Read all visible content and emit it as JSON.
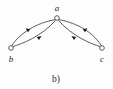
{
  "figure": {
    "caption": "b)",
    "background_color": "#fdfdfd",
    "stroke_color": "#4a4a4a",
    "arrow_color": "#1c1c1c",
    "label_color": "#262626"
  },
  "graph": {
    "type": "directed-graph",
    "nodes": [
      {
        "id": "a",
        "label": "a",
        "x": 57,
        "y": 18,
        "r": 2.3,
        "label_x": 57,
        "label_y": 11
      },
      {
        "id": "b",
        "label": "b",
        "x": 11,
        "y": 48,
        "r": 2.3,
        "label_x": 11,
        "label_y": 62
      },
      {
        "id": "c",
        "label": "c",
        "x": 102,
        "y": 48,
        "r": 2.3,
        "label_x": 102,
        "label_y": 62
      }
    ],
    "edges": [
      {
        "id": "a-to-b",
        "from": "a",
        "to": "b",
        "direction": "a→b",
        "path": "M 55.2 19.6 C 42 22 23 29 11.4 46",
        "arrow_at": {
          "x": 25.5,
          "y": 28.2,
          "angle": 215
        }
      },
      {
        "id": "b-to-a",
        "from": "b",
        "to": "a",
        "direction": "b→a",
        "path": "M 12.6 46.6 C 22 44 42 36 55.6 20.3",
        "arrow_at": {
          "x": 41.5,
          "y": 36.0,
          "angle": 325
        }
      },
      {
        "id": "a-to-c",
        "from": "a",
        "to": "c",
        "direction": "a→c",
        "path": "M 58.8 19.6 C 72 22 91 29 101.6 46",
        "arrow_at": {
          "x": 87.5,
          "y": 28.2,
          "angle": 325
        }
      },
      {
        "id": "c-to-a",
        "from": "c",
        "to": "a",
        "direction": "c→a",
        "path": "M 100.4 46.6 C 91 44 72 36 58.4 20.3",
        "arrow_at": {
          "x": 71.5,
          "y": 36.0,
          "angle": 215
        }
      }
    ]
  }
}
